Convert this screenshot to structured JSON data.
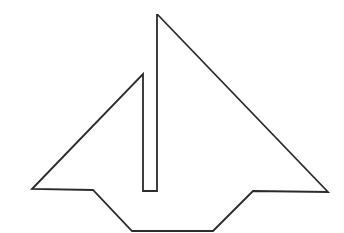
{
  "figure": {
    "width": 344,
    "height": 233,
    "background": "#ffffff",
    "stroke_color": "#2b2b2b",
    "stroke_width": 1.8,
    "outline_points": [
      [
        158,
        15
      ],
      [
        328,
        192
      ],
      [
        253,
        191
      ],
      [
        213,
        231
      ],
      [
        132,
        231
      ],
      [
        93,
        190
      ],
      [
        32,
        189
      ],
      [
        143,
        74
      ],
      [
        143,
        191
      ],
      [
        157,
        191
      ],
      [
        157,
        15
      ]
    ]
  }
}
